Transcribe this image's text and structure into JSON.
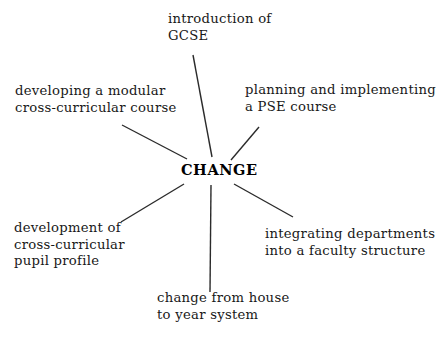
{
  "diagram": {
    "type": "spider-diagram",
    "center": {
      "label": "CHANGE"
    },
    "background_color": "#ffffff",
    "text_color": "#181818",
    "line_color": "#2b2b2b",
    "spokes": [
      {
        "id": "introduction-of-gcse",
        "position": "top",
        "lines": [
          "introduction of",
          "GCSE"
        ],
        "line_start": [
          193,
          55
        ],
        "line_end": [
          212,
          157
        ]
      },
      {
        "id": "developing-a-modular-cross-curricular-course",
        "position": "upper-left",
        "lines": [
          "developing a modular",
          "cross-curricular course"
        ],
        "line_start": [
          122,
          125
        ],
        "line_end": [
          187,
          159
        ]
      },
      {
        "id": "planning-and-implementing-a-pse-course",
        "position": "upper-right",
        "lines": [
          "planning and implementing",
          "a PSE course"
        ],
        "line_start": [
          259,
          127
        ],
        "line_end": [
          231,
          160
        ]
      },
      {
        "id": "development-of-cross-curricular-pupil-profile",
        "position": "lower-left",
        "lines": [
          "development of",
          "cross-curricular",
          "pupil profile"
        ],
        "line_start": [
          121,
          222
        ],
        "line_end": [
          184,
          184
        ]
      },
      {
        "id": "integrating-departments-into-a-faculty-structure",
        "position": "lower-right",
        "lines": [
          "integrating departments",
          "into a faculty structure"
        ],
        "line_start": [
          234,
          184
        ],
        "line_end": [
          293,
          217
        ]
      },
      {
        "id": "change-from-house-to-year-system",
        "position": "bottom",
        "lines": [
          "change from house",
          "to year system"
        ],
        "line_start": [
          211,
          185
        ],
        "line_end": [
          210,
          292
        ]
      }
    ]
  }
}
